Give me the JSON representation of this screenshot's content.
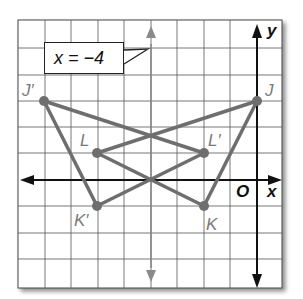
{
  "figure": {
    "callout": {
      "text": "x = −4"
    },
    "axes": {
      "x_label": "x",
      "y_label": "y",
      "origin_label": "O"
    },
    "points": [
      {
        "name": "J",
        "label": "J",
        "px": [
          257,
          101
        ]
      },
      {
        "name": "K",
        "label": "K",
        "px": [
          204,
          206
        ]
      },
      {
        "name": "L",
        "label": "L",
        "px": [
          97,
          153
        ]
      },
      {
        "name": "J-prime",
        "label": "J′",
        "px": [
          44,
          101
        ]
      },
      {
        "name": "K-prime",
        "label": "K′",
        "px": [
          97,
          206
        ]
      },
      {
        "name": "L-prime",
        "label": "L′",
        "px": [
          204,
          153
        ]
      }
    ],
    "triangles": [
      {
        "name": "JKL",
        "vertices": [
          "J",
          "K",
          "L"
        ]
      },
      {
        "name": "J'K'L'",
        "vertices": [
          "J′",
          "K′",
          "L′"
        ]
      }
    ],
    "reflection_line": "x = −4",
    "colors": {
      "figure": "#6e6e6e",
      "grid": "#555555",
      "axis": "#111111",
      "mirror": "#8a8a8a"
    }
  }
}
